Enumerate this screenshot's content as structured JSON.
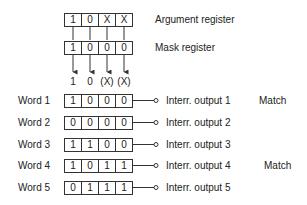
{
  "argument_register": {
    "label": "Argument register",
    "bits": [
      "1",
      "0",
      "X",
      "X"
    ]
  },
  "mask_register": {
    "label": "Mask register",
    "bits": [
      "1",
      "0",
      "0",
      "0"
    ]
  },
  "masked_argument": [
    "1",
    "0",
    "(X)",
    "(X)"
  ],
  "words": [
    {
      "label": "Word 1",
      "bits": [
        "1",
        "0",
        "0",
        "0"
      ],
      "output": "Interr. output 1",
      "status": "Match"
    },
    {
      "label": "Word 2",
      "bits": [
        "0",
        "0",
        "0",
        "0"
      ],
      "output": "Interr. output 2",
      "status": ""
    },
    {
      "label": "Word 3",
      "bits": [
        "1",
        "1",
        "0",
        "0"
      ],
      "output": "Interr. output 3",
      "status": ""
    },
    {
      "label": "Word 4",
      "bits": [
        "1",
        "0",
        "1",
        "1"
      ],
      "output": "Interr. output 4",
      "status": "Match"
    },
    {
      "label": "Word 5",
      "bits": [
        "0",
        "1",
        "1",
        "1"
      ],
      "output": "Interr. output 5",
      "status": ""
    }
  ]
}
